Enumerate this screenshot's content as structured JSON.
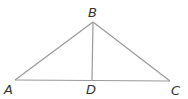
{
  "diagram": {
    "type": "triangle-with-altitude",
    "points": {
      "A": {
        "label": "A",
        "x": 15,
        "y": 80
      },
      "B": {
        "label": "B",
        "x": 93,
        "y": 22
      },
      "C": {
        "label": "C",
        "x": 170,
        "y": 81
      },
      "D": {
        "label": "D",
        "x": 92,
        "y": 80
      }
    },
    "segments": [
      "AB",
      "BC",
      "AC",
      "BD"
    ],
    "line_color": "#9a9a9a",
    "label_color": "#333333"
  }
}
